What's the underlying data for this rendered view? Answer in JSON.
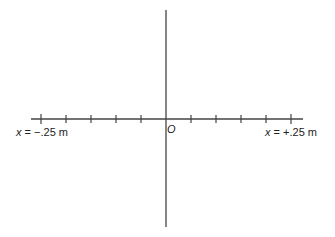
{
  "diagram": {
    "type": "number-line-axes",
    "horizontal_axis": {
      "left_label": {
        "var": "x",
        "text": " = −.25 m"
      },
      "right_label": {
        "var": "x",
        "text": " = +.25 m"
      },
      "tick_count_each_side": 5,
      "range_m": [
        -0.25,
        0.25
      ]
    },
    "origin_label": "O",
    "colors": {
      "line": "#444444",
      "text": "#222222"
    }
  }
}
